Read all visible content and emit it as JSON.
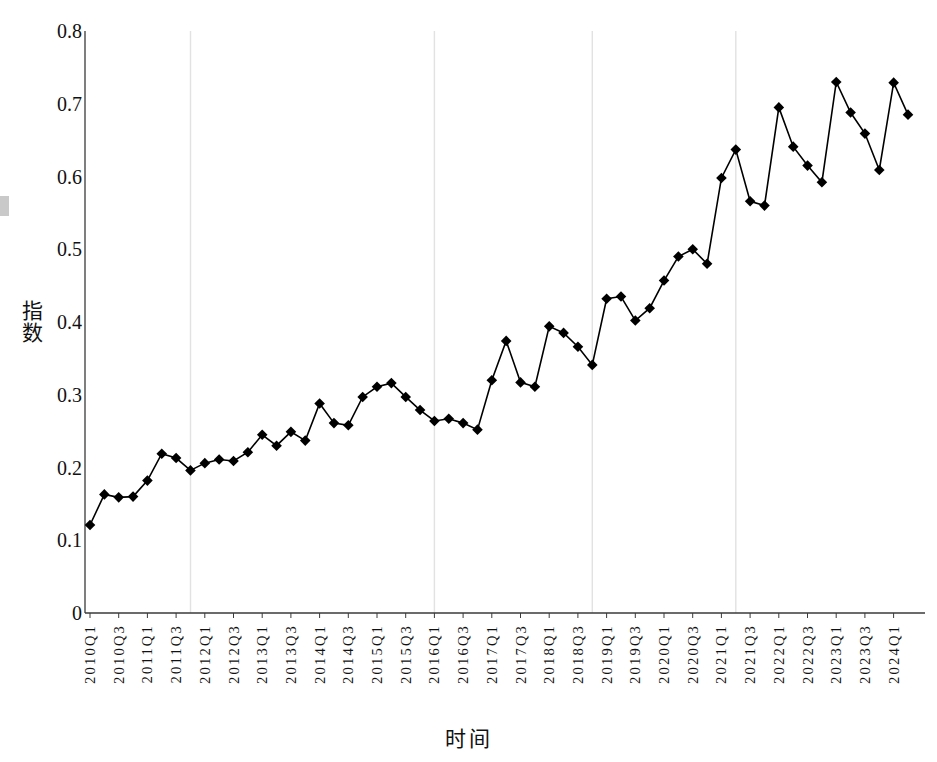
{
  "chart_data": {
    "type": "line",
    "title": "",
    "xlabel": "时间",
    "ylabel": "指数",
    "ylim": [
      0,
      0.8
    ],
    "yticks": [
      "0",
      "0.1",
      "0.2",
      "0.3",
      "0.4",
      "0.5",
      "0.6",
      "0.7",
      "0.8"
    ],
    "ytick_values": [
      0,
      0.1,
      0.2,
      0.3,
      0.4,
      0.5,
      0.6,
      0.7,
      0.8
    ],
    "grid": "vertical-major-only",
    "legend": "none",
    "marker": "diamond",
    "marker_color": "#000000",
    "line_color": "#000000",
    "x": [
      "2010Q1",
      "2010Q2",
      "2010Q3",
      "2010Q4",
      "2011Q1",
      "2011Q2",
      "2011Q3",
      "2011Q4",
      "2012Q1",
      "2012Q2",
      "2012Q3",
      "2012Q4",
      "2013Q1",
      "2013Q2",
      "2013Q3",
      "2013Q4",
      "2014Q1",
      "2014Q2",
      "2014Q3",
      "2014Q4",
      "2015Q1",
      "2015Q2",
      "2015Q3",
      "2015Q4",
      "2016Q1",
      "2016Q2",
      "2016Q3",
      "2016Q4",
      "2017Q1",
      "2017Q2",
      "2017Q3",
      "2017Q4",
      "2018Q1",
      "2018Q2",
      "2018Q3",
      "2018Q4",
      "2019Q1",
      "2019Q2",
      "2019Q3",
      "2019Q4",
      "2020Q1",
      "2020Q2",
      "2020Q3",
      "2020Q4",
      "2021Q1",
      "2021Q2",
      "2021Q3",
      "2021Q4",
      "2022Q1",
      "2022Q2",
      "2022Q3",
      "2022Q4",
      "2023Q1",
      "2023Q2",
      "2023Q3",
      "2023Q4",
      "2024Q1",
      "2024Q2"
    ],
    "values": [
      0.121,
      0.163,
      0.159,
      0.16,
      0.182,
      0.219,
      0.213,
      0.196,
      0.206,
      0.211,
      0.209,
      0.221,
      0.245,
      0.23,
      0.249,
      0.237,
      0.288,
      0.261,
      0.258,
      0.297,
      0.311,
      0.316,
      0.297,
      0.279,
      0.264,
      0.267,
      0.261,
      0.252,
      0.32,
      0.374,
      0.317,
      0.311,
      0.394,
      0.385,
      0.366,
      0.341,
      0.432,
      0.435,
      0.402,
      0.419,
      0.457,
      0.49,
      0.5,
      0.48,
      0.598,
      0.637,
      0.566,
      0.56,
      0.695,
      0.641,
      0.615,
      0.592,
      0.73,
      0.688,
      0.659,
      0.609,
      0.729,
      0.685
    ],
    "xticklabels": [
      "2010Q1",
      "2010Q3",
      "2011Q1",
      "2011Q3",
      "2012Q1",
      "2012Q3",
      "2013Q1",
      "2013Q3",
      "2014Q1",
      "2014Q3",
      "2015Q1",
      "2015Q3",
      "2016Q1",
      "2016Q3",
      "2017Q1",
      "2017Q3",
      "2018Q1",
      "2018Q3",
      "2019Q1",
      "2019Q3",
      "2020Q1",
      "2020Q3",
      "2021Q1",
      "2021Q3",
      "2022Q1",
      "2022Q3",
      "2023Q1",
      "2023Q3",
      "2024Q1"
    ],
    "xticklabel_indices": [
      0,
      2,
      4,
      6,
      8,
      10,
      12,
      14,
      16,
      18,
      20,
      22,
      24,
      26,
      28,
      30,
      32,
      34,
      36,
      38,
      40,
      42,
      44,
      46,
      48,
      50,
      52,
      54,
      56
    ],
    "gridline_x_labels": [
      "2011Q4",
      "2016Q1",
      "2018Q4",
      "2021Q2"
    ],
    "gridline_x_indices": [
      7,
      24,
      35,
      45
    ]
  }
}
